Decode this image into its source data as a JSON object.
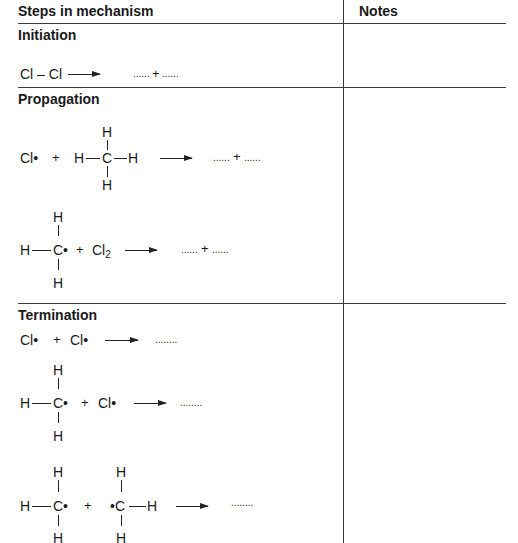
{
  "table": {
    "headers": {
      "steps": "Steps in mechanism",
      "notes": "Notes"
    },
    "sections": [
      {
        "title": "Initiation"
      },
      {
        "title": "Propagation"
      },
      {
        "title": "Termination"
      }
    ]
  },
  "initiation": {
    "reactant": "Cl – Cl",
    "product_blank_1": "......",
    "plus": "+",
    "product_blank_2": "......"
  },
  "propagation": {
    "step1": {
      "radical": "Cl•",
      "plus": "+",
      "methane": {
        "top": "H",
        "left": "H",
        "center": "C",
        "right": "H",
        "bottom": "H"
      },
      "product_blank_1": "......",
      "product_plus": "+",
      "product_blank_2": "......"
    },
    "step2": {
      "methyl": {
        "top": "H",
        "left": "H",
        "center": "C•",
        "bottom": "H"
      },
      "plus": "+",
      "chlorine": "Cl",
      "chlorine_sub": "2",
      "product_blank_1": "......",
      "product_plus": "+",
      "product_blank_2": "......"
    }
  },
  "termination": {
    "step1": {
      "radical_1": "Cl•",
      "plus": "+",
      "radical_2": "Cl•",
      "product_blank": "........"
    },
    "step2": {
      "methyl": {
        "top": "H",
        "left": "H",
        "center": "C•",
        "bottom": "H"
      },
      "plus": "+",
      "radical": "Cl•",
      "product_blank": "........"
    },
    "step3": {
      "methyl_1": {
        "top": "H",
        "left": "H",
        "center": "C•",
        "bottom": "H"
      },
      "plus": "+",
      "methyl_2": {
        "top": "H",
        "center": "•C",
        "right": "H",
        "bottom": "H"
      },
      "product_blank": "........"
    }
  }
}
